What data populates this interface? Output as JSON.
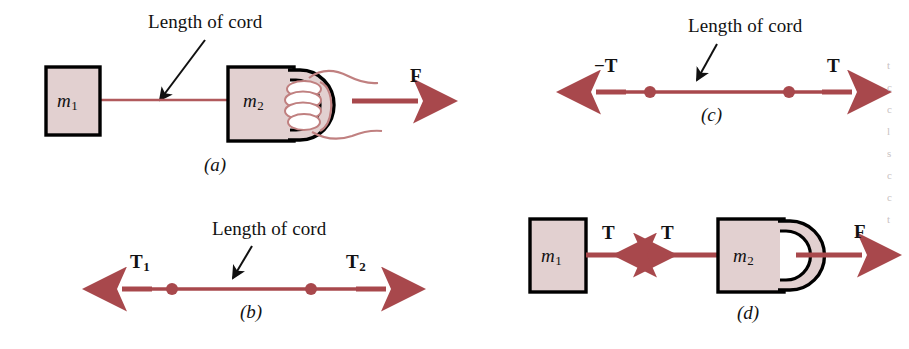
{
  "figure": {
    "colors": {
      "arrow_red": "#a8484c",
      "cord_red": "#b15a5c",
      "block_fill": "#e2d0d0",
      "block_stroke": "#000000",
      "leader_line": "#000000",
      "hand_outline": "#c08080",
      "background": "#ffffff"
    }
  },
  "panels": [
    {
      "id": "a",
      "id_label": "(a)",
      "annotation": "Length of cord",
      "masses": [
        {
          "symbol": "m",
          "sub": "1"
        },
        {
          "symbol": "m",
          "sub": "2"
        }
      ],
      "forces": [
        {
          "symbol": "F",
          "sub": "",
          "direction": "right"
        }
      ],
      "has_hand": true,
      "has_handle": true
    },
    {
      "id": "b",
      "id_label": "(b)",
      "annotation": "Length of cord",
      "masses": [],
      "forces": [
        {
          "symbol": "T",
          "sub": "1",
          "direction": "left"
        },
        {
          "symbol": "T",
          "sub": "2",
          "direction": "right"
        }
      ],
      "dots": 2,
      "has_hand": false,
      "has_handle": false
    },
    {
      "id": "c",
      "id_label": "(c)",
      "annotation": "Length of cord",
      "masses": [],
      "forces": [
        {
          "symbol": "−T",
          "sub": "",
          "direction": "left"
        },
        {
          "symbol": "T",
          "sub": "",
          "direction": "right"
        }
      ],
      "dots": 2,
      "has_hand": false,
      "has_handle": false
    },
    {
      "id": "d",
      "id_label": "(d)",
      "annotation": "",
      "masses": [
        {
          "symbol": "m",
          "sub": "1"
        },
        {
          "symbol": "m",
          "sub": "2"
        }
      ],
      "forces": [
        {
          "symbol": "T",
          "sub": "",
          "direction": "right"
        },
        {
          "symbol": "T",
          "sub": "",
          "direction": "left"
        },
        {
          "symbol": "F",
          "sub": "",
          "direction": "right"
        }
      ],
      "has_hand": false,
      "has_handle": true
    }
  ],
  "labels": {
    "length_of_cord_a": "Length of cord",
    "length_of_cord_b": "Length of cord",
    "length_of_cord_c": "Length of cord",
    "panel_a": "(a)",
    "panel_b": "(b)",
    "panel_c": "(c)",
    "panel_d": "(d)",
    "m_a1": "m",
    "m_a1_sub": "1",
    "m_a2": "m",
    "m_a2_sub": "2",
    "m_d1": "m",
    "m_d1_sub": "1",
    "m_d2": "m",
    "m_d2_sub": "2",
    "F_a": "F",
    "T_b1": "T",
    "T_b1_sub": "1",
    "T_b2": "T",
    "T_b2_sub": "2",
    "negT_c": "−T",
    "T_c": "T",
    "T_d1": "T",
    "T_d2": "T",
    "F_d": "F"
  },
  "edge_fragments": [
    "t",
    "c",
    "c",
    "l",
    "s",
    "c",
    "c",
    "t"
  ]
}
